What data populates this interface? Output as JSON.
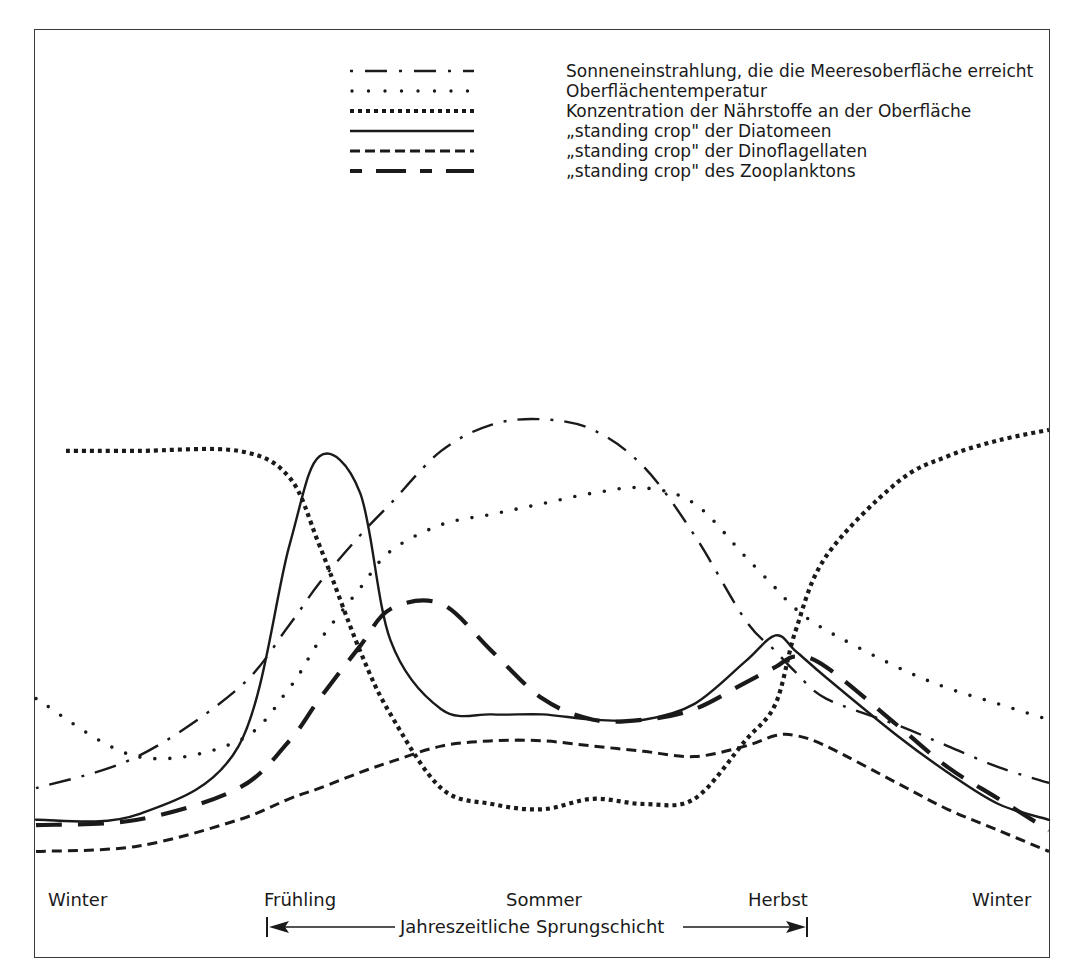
{
  "chart_data": {
    "type": "line",
    "title": "",
    "xlabel": "",
    "ylabel": "",
    "grid": false,
    "legend_position": "top-right",
    "x_categories": [
      "Winter",
      "Frühling",
      "Sommer",
      "Herbst",
      "Winter"
    ],
    "annotation": {
      "label": "Jahreszeitliche Sprungschicht",
      "span_from": "Frühling",
      "span_to": "Herbst"
    },
    "note": "Qualitative curves; values are relative heights (0 = bottom, 100 = top) sampled across the year from left Winter (x=0) to right Winter (x=100).",
    "x": [
      0,
      10,
      20,
      25,
      28,
      32,
      35,
      40,
      45,
      50,
      55,
      60,
      65,
      70,
      73,
      75,
      78,
      85,
      90,
      95,
      100
    ],
    "series": [
      {
        "name": "Sonneneinstrahlung, die die Meeresoberfläche erreicht",
        "style": "dash-dot",
        "values": [
          14,
          20,
          33,
          45,
          53,
          62,
          68,
          78,
          83,
          84,
          82,
          75,
          62,
          46,
          40,
          36,
          31,
          26,
          22,
          18,
          15
        ]
      },
      {
        "name": "Oberflächentemperatur",
        "style": "dotted",
        "values": [
          31,
          20,
          23,
          33,
          42,
          52,
          59,
          64,
          66,
          68,
          70,
          71,
          68,
          58,
          52,
          48,
          44,
          37,
          33,
          30,
          27
        ]
      },
      {
        "name": "Konzentration der Nährstoffe an der Oberfläche",
        "style": "dense-dotted",
        "values": [
          78,
          78,
          78,
          73,
          60,
          40,
          28,
          14,
          11,
          10,
          12,
          11,
          12,
          23,
          30,
          44,
          58,
          72,
          77,
          80,
          82
        ]
      },
      {
        "name": "„standing crop\" der Diatomeen",
        "style": "solid",
        "values": [
          8,
          9,
          22,
          60,
          77,
          70,
          42,
          29,
          28,
          28,
          27,
          27,
          30,
          38,
          43,
          40,
          35,
          24,
          17,
          11,
          8
        ]
      },
      {
        "name": "„standing crop\" der Dinoflagellaten",
        "style": "short-dashed",
        "values": [
          2,
          3,
          8,
          12,
          14,
          17,
          19,
          22,
          23,
          23,
          22,
          21,
          20,
          22,
          24,
          24,
          22,
          15,
          10,
          6,
          2
        ]
      },
      {
        "name": "„standing crop\" des Zooplanktons",
        "style": "long-dashed",
        "values": [
          7,
          8,
          14,
          23,
          31,
          41,
          48,
          49,
          40,
          31,
          27,
          27,
          29,
          34,
          37,
          39,
          37,
          26,
          18,
          12,
          6
        ]
      }
    ]
  },
  "legend": {
    "items": [
      {
        "label": "Sonneneinstrahlung, die die Meeresoberfläche erreicht",
        "style": "dash-dot"
      },
      {
        "label": "Oberflächentemperatur",
        "style": "dotted"
      },
      {
        "label": "Konzentration der Nährstoffe an der Oberfläche",
        "style": "dense-dotted"
      },
      {
        "label": "„standing crop\" der Diatomeen",
        "style": "solid"
      },
      {
        "label": "„standing crop\" der Dinoflagellaten",
        "style": "short-dashed"
      },
      {
        "label": "„standing crop\" des Zooplanktons",
        "style": "long-dashed"
      }
    ]
  },
  "axis": {
    "seasons": [
      {
        "label": "Winter",
        "x": 48
      },
      {
        "label": "Frühling",
        "x": 264
      },
      {
        "label": "Sommer",
        "x": 506
      },
      {
        "label": "Herbst",
        "x": 750
      },
      {
        "label": "Winter",
        "x": 974
      }
    ],
    "thermocline": {
      "label": "Jahreszeitliche Sprungschicht"
    }
  },
  "colors": {
    "line": "#1a1a1a",
    "frame": "#3a3a3a",
    "background": "#ffffff"
  }
}
